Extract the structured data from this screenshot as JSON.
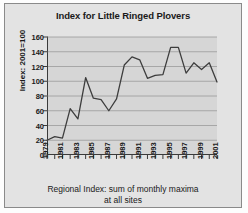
{
  "chart_data": {
    "type": "line",
    "title": "Index for Little Ringed Plovers",
    "ylabel": "Index: 2001=100",
    "xlabel_line1": "Regional Index: sum of monthly maxima",
    "xlabel_line2": "at all sites",
    "xlabel": "Regional Index: sum of monthly maxima at all sites",
    "x": [
      1979,
      1980,
      1981,
      1982,
      1983,
      1984,
      1985,
      1986,
      1987,
      1988,
      1989,
      1990,
      1991,
      1992,
      1993,
      1994,
      1995,
      1996,
      1997,
      1998,
      1999,
      2000,
      2001
    ],
    "values": [
      20,
      25,
      23,
      63,
      49,
      105,
      77,
      75,
      60,
      76,
      122,
      133,
      129,
      104,
      108,
      109,
      146,
      146,
      111,
      125,
      116,
      125,
      99
    ],
    "series": [
      {
        "name": "Little Ringed Plover index",
        "values": [
          20,
          25,
          23,
          63,
          49,
          105,
          77,
          75,
          60,
          76,
          122,
          133,
          129,
          104,
          108,
          109,
          146,
          146,
          111,
          125,
          116,
          125,
          99
        ]
      }
    ],
    "xlim": [
      1979,
      2001
    ],
    "ylim": [
      0,
      160
    ],
    "yticks": [
      0,
      20,
      40,
      60,
      80,
      100,
      120,
      140,
      160
    ],
    "xticks_labeled": [
      1979,
      1981,
      1983,
      1985,
      1987,
      1989,
      1991,
      1993,
      1995,
      1997,
      1999,
      2001
    ],
    "grid": "horizontal",
    "legend": "none",
    "line_color": "#3d3d3d",
    "plot_background": "#d6d6d6",
    "figure_background": "#e3e3e3"
  }
}
